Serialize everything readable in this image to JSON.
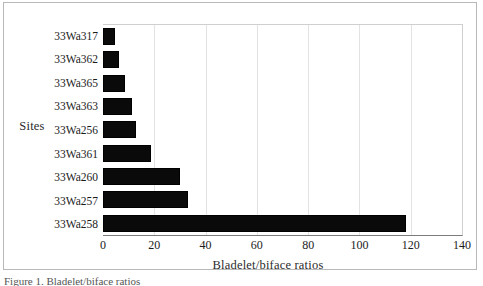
{
  "chart_data": {
    "type": "bar",
    "orientation": "horizontal",
    "title": "",
    "xlabel": "Bladelet/biface ratios",
    "ylabel": "Sites",
    "categories": [
      "33Wa317",
      "33Wa362",
      "33Wa365",
      "33Wa363",
      "33Wa256",
      "33Wa361",
      "33Wa260",
      "33Wa257",
      "33Wa258"
    ],
    "values": [
      4.5,
      6.4,
      8.5,
      11.5,
      12.8,
      18.7,
      30.0,
      33.2,
      118.0
    ],
    "xlim": [
      0,
      140
    ],
    "xticks": [
      0,
      20,
      40,
      60,
      80,
      100,
      120,
      140
    ],
    "xtick_labels": [
      "0",
      "20",
      "40",
      "60",
      "80",
      "100",
      "120",
      "140"
    ],
    "grid": "vertical",
    "legend": "none",
    "bar_color": "#0a0a0a"
  },
  "caption": {
    "text": "Figure 1. Bladelet/biface ratios"
  },
  "colors": {
    "bar": "#0a0a0a",
    "gridline": "#e3e3e3",
    "axis": "#7c7c7c",
    "frame": "#b9b9b9",
    "text": "#1b1b1b"
  }
}
